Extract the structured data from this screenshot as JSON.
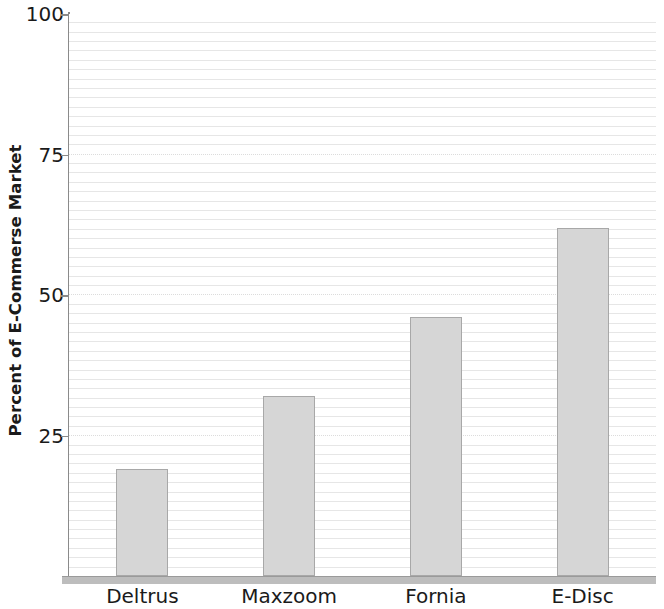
{
  "chart_data": {
    "type": "bar",
    "title": "",
    "xlabel": "",
    "ylabel": "Percent of E-Commerse Market",
    "categories": [
      "Deltrus",
      "Maxzoom",
      "Fornia",
      "E-Disc"
    ],
    "values": [
      19,
      32,
      46,
      62
    ],
    "ylim": [
      0,
      100
    ],
    "ytick_labels": [
      "100",
      "75",
      "50",
      "25"
    ],
    "ytick_values": [
      100,
      75,
      50,
      25
    ],
    "ytick_step": 25,
    "minor_gridline_step": 1.67,
    "grid": true,
    "legend": "none",
    "bar_fill_color": "#d6d6d6",
    "bar_border_color": "#a8a8a8",
    "gridline_color": "#e6e6e6",
    "axis_color": "#8a8a8a",
    "baseline_color": "#bdbdbd",
    "text_color": "#1a1a1a",
    "background_color": "#ffffff"
  }
}
